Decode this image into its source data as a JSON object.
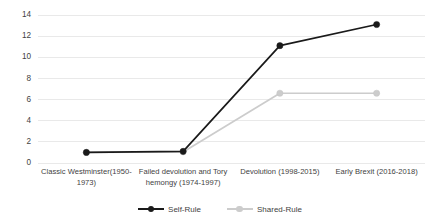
{
  "chart_data": {
    "type": "line",
    "title": "",
    "subtitle": "",
    "xlabel": "",
    "ylabel": "",
    "ylim": [
      0,
      14
    ],
    "ytick_step": 2,
    "yticks": [
      "0",
      "2",
      "4",
      "6",
      "8",
      "10",
      "12",
      "14"
    ],
    "grid": "horizontal",
    "legend_position": "bottom",
    "categories": [
      "Classic Westminster(1950-1973)",
      "Failed devolution and Tory hemongy (1974-1997)",
      "Devolution (1998-2015)",
      "Early Brexit (2016-2018)"
    ],
    "series": [
      {
        "name": "Self-Rule",
        "color": "#1a1a1a",
        "marker": "circle-filled",
        "values": [
          1.0,
          1.1,
          11.1,
          13.1
        ]
      },
      {
        "name": "Shared-Rule",
        "color": "#cccccc",
        "marker": "circle-filled",
        "values": [
          1.0,
          1.05,
          6.6,
          6.6
        ]
      }
    ]
  },
  "axis": {
    "y_ticks": [
      {
        "label": "14",
        "value": 14
      },
      {
        "label": "12",
        "value": 12
      },
      {
        "label": "10",
        "value": 10
      },
      {
        "label": "8",
        "value": 8
      },
      {
        "label": "6",
        "value": 6
      },
      {
        "label": "4",
        "value": 4
      },
      {
        "label": "2",
        "value": 2
      },
      {
        "label": "0",
        "value": 0
      }
    ],
    "x_categories": [
      "Classic Westminster(1950-1973)",
      "Failed devolution and Tory hemongy (1974-1997)",
      "Devolution (1998-2015)",
      "Early Brexit (2016-2018)"
    ]
  },
  "legend": {
    "items": [
      {
        "label": "Self-Rule",
        "color": "#1a1a1a"
      },
      {
        "label": "Shared-Rule",
        "color": "#cccccc"
      }
    ]
  },
  "colors": {
    "self_rule": "#1a1a1a",
    "shared_rule": "#cccccc",
    "gridline": "#e4e4e4",
    "text": "#3f3f3f",
    "background": "#ffffff"
  }
}
